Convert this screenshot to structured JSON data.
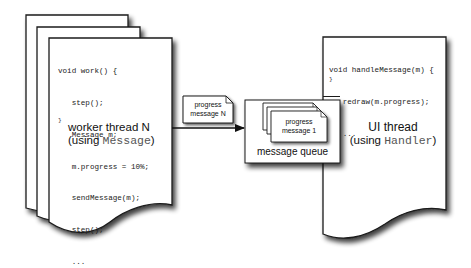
{
  "worker": {
    "code_lines": [
      "void work() {",
      "   step();",
      "   Message m;",
      "   m.progress = 10%;",
      "   sendMessage(m);",
      "   step();",
      "   ...",
      "}"
    ],
    "title": "worker thread N",
    "subtitle_prefix": "(using ",
    "subtitle_class": "Message",
    "subtitle_suffix": ")"
  },
  "in_flight_message": {
    "line1": "progress",
    "line2": "message N"
  },
  "queue": {
    "label": "message queue",
    "head_message": {
      "line1": "progress",
      "line2": "message 1"
    }
  },
  "ui": {
    "code_lines": [
      "void handleMessage(m) {",
      "   redraw(m.progress);",
      "   ...",
      "}"
    ],
    "title": "UI thread",
    "subtitle_prefix": "(using ",
    "subtitle_class": "Handler",
    "subtitle_suffix": ")"
  },
  "colors": {
    "stroke": "#1a1a1a",
    "paper": "#ffffff",
    "shadow": "#000000"
  }
}
